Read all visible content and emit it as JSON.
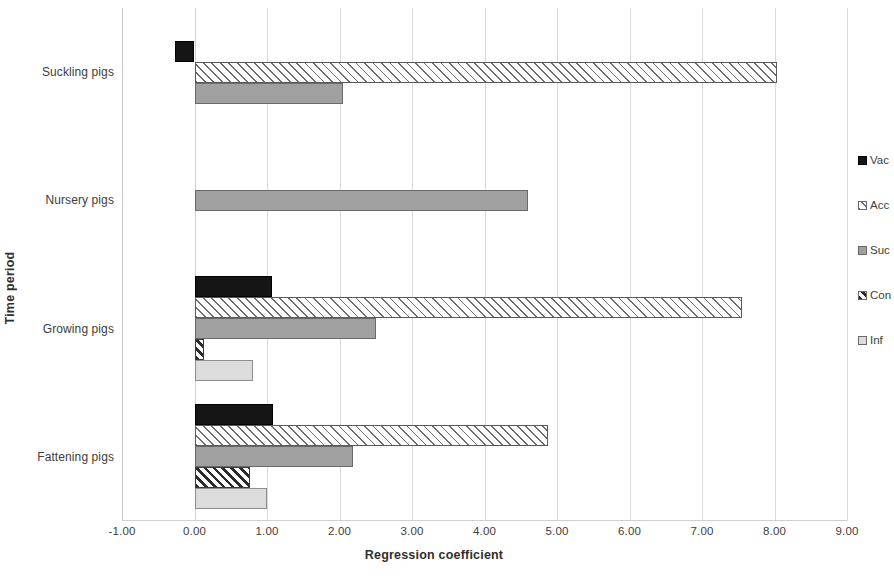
{
  "chart_data": {
    "type": "bar",
    "orientation": "horizontal",
    "title": "",
    "xlabel": "Regression coefficient",
    "ylabel": "Time period",
    "categories": [
      "Suckling pigs",
      "Nursery pigs",
      "Growing pigs",
      "Fattening pigs"
    ],
    "xlim": [
      -1.0,
      9.0
    ],
    "xticks": [
      "-1.00",
      "0.00",
      "1.00",
      "2.00",
      "3.00",
      "4.00",
      "5.00",
      "6.00",
      "7.00",
      "8.00",
      "9.00"
    ],
    "xtick_values": [
      -1,
      0,
      1,
      2,
      3,
      4,
      5,
      6,
      7,
      8,
      9
    ],
    "grid": true,
    "legend_position": "right",
    "series": [
      {
        "name": "Vac",
        "key": "vac",
        "color": "#151515",
        "pattern": "solid-black",
        "values": [
          -0.27,
          null,
          1.07,
          1.08
        ]
      },
      {
        "name": "Acc",
        "key": "acc",
        "color": "#ffffff",
        "pattern": "diagonal-hatch-light",
        "values": [
          8.03,
          null,
          7.55,
          4.88
        ]
      },
      {
        "name": "Suc",
        "key": "suc",
        "color": "#a0a0a0",
        "pattern": "solid-gray",
        "values": [
          2.05,
          4.6,
          2.5,
          2.18
        ]
      },
      {
        "name": "Con",
        "key": "con",
        "color": "#ffffff",
        "pattern": "diagonal-hatch-dark",
        "values": [
          null,
          null,
          0.13,
          0.77
        ]
      },
      {
        "name": "Inf",
        "key": "inf",
        "color": "#dcdcdc",
        "pattern": "solid-light-gray",
        "values": [
          null,
          null,
          0.81,
          1.0
        ]
      }
    ]
  },
  "legend": {
    "items": [
      {
        "label": "Vac",
        "key": "vac"
      },
      {
        "label": "Acc",
        "key": "acc"
      },
      {
        "label": "Suc",
        "key": "suc"
      },
      {
        "label": "Con",
        "key": "con"
      },
      {
        "label": "Inf",
        "key": "inf"
      }
    ]
  }
}
